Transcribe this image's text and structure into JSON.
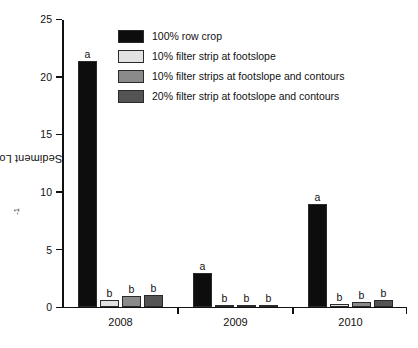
{
  "chart_data": {
    "type": "bar",
    "title": "",
    "xlabel": "",
    "ylabel": "Sediment Loss (Mg ha",
    "ylabel_sup": "-1",
    "ylabel_tail": ")",
    "ylim": [
      0,
      25
    ],
    "yticks": [
      0,
      5,
      10,
      15,
      20,
      25
    ],
    "ytick_labels": [
      "0",
      "5",
      "10",
      "15",
      "20",
      "25"
    ],
    "grid": false,
    "legend_position": "upper-center",
    "categories": [
      "2008",
      "2009",
      "2010"
    ],
    "series": [
      {
        "name": "100% row crop",
        "color": "#0d0d0d",
        "values": [
          21.3,
          2.9,
          8.9
        ],
        "annotations": [
          "a",
          "a",
          "a"
        ]
      },
      {
        "name": "10% filter strip at footslope",
        "color": "#e2e2e2",
        "values": [
          0.6,
          0.1,
          0.2
        ],
        "annotations": [
          "b",
          "b",
          "b"
        ]
      },
      {
        "name": "10% filter strips at footslope and contours",
        "color": "#8a8a8a",
        "values": [
          0.9,
          0.15,
          0.35
        ],
        "annotations": [
          "b",
          "b",
          "b"
        ]
      },
      {
        "name": "20% filter strip at footslope and contours",
        "color": "#545454",
        "values": [
          1.0,
          0.15,
          0.6
        ],
        "annotations": [
          "b",
          "b",
          "b"
        ]
      }
    ]
  },
  "legend": {
    "items": [
      {
        "label": "100% row crop",
        "color": "#0d0d0d"
      },
      {
        "label": "10% filter strip at footslope",
        "color": "#e2e2e2"
      },
      {
        "label": "10% filter strips at footslope and contours",
        "color": "#8a8a8a"
      },
      {
        "label": "20% filter strip at footslope and contours",
        "color": "#545454"
      }
    ]
  }
}
